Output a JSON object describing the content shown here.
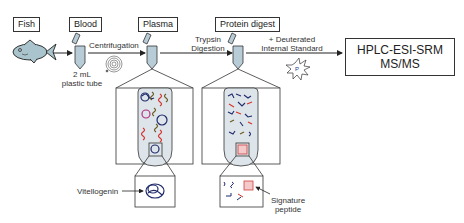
{
  "diagram": {
    "stages": [
      {
        "label": "Fish"
      },
      {
        "label": "Blood"
      },
      {
        "label": "Plasma"
      },
      {
        "label": "Protein digest"
      }
    ],
    "steps": {
      "centrifugation": "Centrifugation",
      "trypsin_line1": "Trypsin",
      "trypsin_line2": "Digestion",
      "standard_line1": "+ Deuterated",
      "standard_line2": "Internal Standard"
    },
    "tube_note_line1": "2 mL",
    "tube_note_line2": "plastic tube",
    "instrument_line1": "HPLC-ESI-SRM",
    "instrument_line2": "MS/MS",
    "callouts": {
      "vitellogenin": "Vitellogenin",
      "signature_line1": "Signature",
      "signature_line2": "peptide"
    },
    "colors": {
      "tube_fill": "#b7ccd6",
      "fish_fill": "#a9c4cc",
      "protein_dark": "#1f2a6b",
      "protein_red": "#d4322a",
      "protein_brown": "#6b5a1f",
      "protein_pink": "#b03080",
      "highlight_box": "#d04040"
    }
  }
}
